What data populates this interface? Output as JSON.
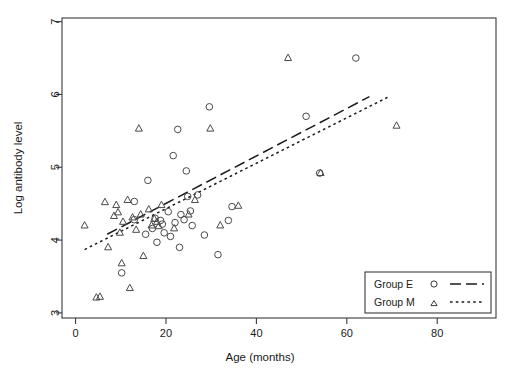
{
  "chart_data": {
    "type": "scatter",
    "title": "",
    "xlabel": "Age (months)",
    "ylabel": "Log antibody level",
    "xlim": [
      -3,
      93
    ],
    "ylim": [
      2.93,
      7.05
    ],
    "xticks": [
      0,
      20,
      40,
      60,
      80
    ],
    "yticks": [
      3,
      4,
      5,
      6,
      7
    ],
    "grid": false,
    "legend_position": "bottom-right",
    "legend": [
      {
        "name": "Group E",
        "marker": "circle",
        "line": "dashed"
      },
      {
        "name": "Group M",
        "marker": "triangle",
        "line": "dotted"
      }
    ],
    "series": [
      {
        "name": "Group E",
        "marker": "circle",
        "points": [
          [
            10.2,
            3.55
          ],
          [
            13.0,
            4.28
          ],
          [
            13.0,
            4.53
          ],
          [
            15.5,
            4.08
          ],
          [
            16.0,
            4.82
          ],
          [
            17.0,
            4.16
          ],
          [
            17.6,
            4.3
          ],
          [
            18.0,
            3.97
          ],
          [
            18.8,
            4.27
          ],
          [
            19.2,
            4.22
          ],
          [
            19.6,
            4.1
          ],
          [
            20.5,
            4.39
          ],
          [
            21.0,
            4.05
          ],
          [
            21.6,
            5.16
          ],
          [
            22.0,
            4.24
          ],
          [
            22.6,
            5.52
          ],
          [
            23.0,
            3.9
          ],
          [
            23.3,
            4.35
          ],
          [
            24.0,
            4.28
          ],
          [
            24.5,
            4.95
          ],
          [
            24.8,
            4.6
          ],
          [
            25.4,
            4.4
          ],
          [
            25.8,
            4.2
          ],
          [
            27.0,
            4.62
          ],
          [
            28.5,
            4.07
          ],
          [
            29.6,
            5.83
          ],
          [
            31.5,
            3.8
          ],
          [
            33.8,
            4.27
          ],
          [
            34.6,
            4.46
          ],
          [
            51.0,
            5.7
          ],
          [
            54.0,
            4.92
          ],
          [
            62.0,
            6.5
          ]
        ]
      },
      {
        "name": "Group M",
        "marker": "triangle",
        "points": [
          [
            2.0,
            4.2
          ],
          [
            4.6,
            3.21
          ],
          [
            5.4,
            3.22
          ],
          [
            6.5,
            4.52
          ],
          [
            7.2,
            3.9
          ],
          [
            8.5,
            4.33
          ],
          [
            9.0,
            4.48
          ],
          [
            9.4,
            4.38
          ],
          [
            9.8,
            4.1
          ],
          [
            10.2,
            3.68
          ],
          [
            10.5,
            4.25
          ],
          [
            11.5,
            4.55
          ],
          [
            12.0,
            3.34
          ],
          [
            12.6,
            4.31
          ],
          [
            13.4,
            4.14
          ],
          [
            14.0,
            5.53
          ],
          [
            14.4,
            4.35
          ],
          [
            15.0,
            3.78
          ],
          [
            16.2,
            4.42
          ],
          [
            16.8,
            4.2
          ],
          [
            17.4,
            4.29
          ],
          [
            18.0,
            4.25
          ],
          [
            18.4,
            4.19
          ],
          [
            19.0,
            4.48
          ],
          [
            21.8,
            4.16
          ],
          [
            25.0,
            4.35
          ],
          [
            26.4,
            4.55
          ],
          [
            29.8,
            5.53
          ],
          [
            32.0,
            4.2
          ],
          [
            36.0,
            4.47
          ],
          [
            47.0,
            6.5
          ],
          [
            54.2,
            4.92
          ],
          [
            71.0,
            5.57
          ]
        ]
      }
    ],
    "trendlines": [
      {
        "name": "Group E",
        "style": "dashed",
        "x0": 7.0,
        "y0": 4.08,
        "x1": 65.0,
        "y1": 5.97
      },
      {
        "name": "Group M",
        "style": "dotted",
        "x0": 2.0,
        "y0": 3.87,
        "x1": 69.0,
        "y1": 5.96
      }
    ]
  }
}
